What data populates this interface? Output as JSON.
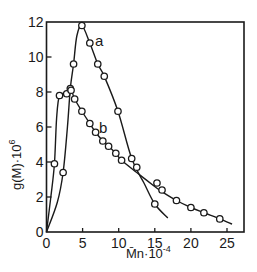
{
  "chart_data": {
    "type": "line",
    "title": "",
    "xlabel": "M̄n·10⁻⁴",
    "ylabel": "g(M)·10⁶",
    "xlim": [
      0,
      27
    ],
    "ylim": [
      0,
      12
    ],
    "xticks": [
      0,
      5,
      10,
      15,
      20,
      25
    ],
    "yticks": [
      0,
      2,
      4,
      6,
      8,
      10,
      12
    ],
    "grid": false,
    "legend": "inline labels",
    "series": [
      {
        "name": "a",
        "points": [
          [
            2.3,
            3.4
          ],
          [
            3.3,
            8.2
          ],
          [
            3.75,
            9.6
          ],
          [
            4.9,
            11.8
          ],
          [
            6.0,
            10.8
          ],
          [
            7.1,
            9.6
          ],
          [
            8.0,
            8.9
          ],
          [
            9.9,
            6.9
          ],
          [
            11.8,
            4.2
          ],
          [
            15.0,
            1.6
          ]
        ],
        "curve": [
          [
            0,
            0
          ],
          [
            1.5,
            1.7
          ],
          [
            2.3,
            3.4
          ],
          [
            2.9,
            6.0
          ],
          [
            3.3,
            8.2
          ],
          [
            3.75,
            9.6
          ],
          [
            4.2,
            11.2
          ],
          [
            4.9,
            11.8
          ],
          [
            6.0,
            10.8
          ],
          [
            7.1,
            9.6
          ],
          [
            8.0,
            8.9
          ],
          [
            9.9,
            6.9
          ],
          [
            11.8,
            4.2
          ],
          [
            13.5,
            2.8
          ],
          [
            15.0,
            1.6
          ],
          [
            16.8,
            0.8
          ]
        ]
      },
      {
        "name": "b",
        "points": [
          [
            1.1,
            3.9
          ],
          [
            1.8,
            7.8
          ],
          [
            2.8,
            7.9
          ],
          [
            3.4,
            8.1
          ],
          [
            3.9,
            7.6
          ],
          [
            4.9,
            6.9
          ],
          [
            6.0,
            6.2
          ],
          [
            6.8,
            5.7
          ],
          [
            7.8,
            5.2
          ],
          [
            8.6,
            4.9
          ],
          [
            9.6,
            4.5
          ],
          [
            10.4,
            4.1
          ],
          [
            12.5,
            3.7
          ],
          [
            15.3,
            2.8
          ],
          [
            16.0,
            2.4
          ],
          [
            18.0,
            1.8
          ],
          [
            20.0,
            1.4
          ],
          [
            21.8,
            1.1
          ],
          [
            24.0,
            0.75
          ]
        ],
        "curve": [
          [
            0,
            0
          ],
          [
            0.6,
            2.0
          ],
          [
            1.1,
            3.9
          ],
          [
            1.4,
            6.5
          ],
          [
            1.8,
            7.8
          ],
          [
            2.8,
            7.9
          ],
          [
            3.4,
            8.1
          ],
          [
            3.9,
            7.6
          ],
          [
            4.9,
            6.9
          ],
          [
            6.0,
            6.2
          ],
          [
            6.8,
            5.7
          ],
          [
            7.8,
            5.2
          ],
          [
            8.6,
            4.9
          ],
          [
            9.6,
            4.5
          ],
          [
            10.4,
            4.1
          ],
          [
            12.5,
            3.4
          ],
          [
            15.3,
            2.5
          ],
          [
            16.0,
            2.3
          ],
          [
            18.0,
            1.8
          ],
          [
            20.0,
            1.4
          ],
          [
            21.8,
            1.1
          ],
          [
            24.0,
            0.75
          ],
          [
            25.7,
            0.45
          ]
        ]
      }
    ],
    "annotations": [
      {
        "text": "a",
        "x": 7.0,
        "y": 11.4
      },
      {
        "text": "b",
        "x": 7.6,
        "y": 6.0
      }
    ]
  },
  "labels": {
    "y_axis": "g(M)·10",
    "y_axis_exp": "6",
    "x_axis": "M̄n·10",
    "x_axis_exp": "-4",
    "series_a": "a",
    "series_b": "b"
  }
}
